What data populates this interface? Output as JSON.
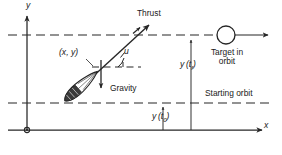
{
  "figure": {
    "title_semantic": "rocket-ascent-trajectory-diagram",
    "background_color": "#ffffff",
    "line_color": "#262626",
    "axes": {
      "y_axis_label": "y",
      "x_axis_label": "x",
      "origin_marker": "origin-dot"
    },
    "labels": {
      "thrust": "Thrust",
      "gravity": "Gravity",
      "position": "(x, y)",
      "control_angle": "u",
      "target": "Target in\norbit",
      "target_line1": "Target in",
      "target_line2": "orbit",
      "starting_orbit": "Starting orbit",
      "height_final_main": "y",
      "height_final_arg": "(t",
      "height_final_sub": "f",
      "height_final_close": ")",
      "height_initial_main": "y",
      "height_initial_arg": "(t",
      "height_initial_sub": "0",
      "height_initial_close": ")"
    },
    "geometry": {
      "target_orbit_dashed_y": 35,
      "starting_orbit_dashed_y": 103,
      "x_axis_y": 130,
      "y_axis_x": 27,
      "target_circle_cx": 226,
      "target_circle_cy": 35,
      "target_circle_r": 9,
      "vehicle_angle_deg": 35,
      "height_final_x": 191,
      "height_initial_x": 163
    }
  }
}
